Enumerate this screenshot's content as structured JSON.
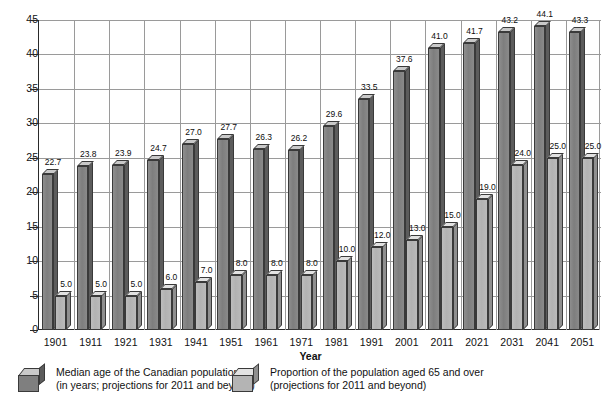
{
  "chart_data": {
    "type": "bar",
    "title": "",
    "subtitle": "",
    "xlabel": "Year",
    "ylabel": "",
    "grid": true,
    "legend_position": "bottom",
    "ylim": [
      0,
      45
    ],
    "yticks": [
      0,
      5,
      10,
      15,
      20,
      25,
      30,
      35,
      40,
      45
    ],
    "categories": [
      "1901",
      "1911",
      "1921",
      "1931",
      "1941",
      "1951",
      "1961",
      "1971",
      "1981",
      "1991",
      "2001",
      "2011",
      "2021",
      "2031",
      "2041",
      "2051"
    ],
    "series": [
      {
        "name": "Median age of the Canadian population",
        "name_line2": "(in years; projections for 2011 and beyond)",
        "color": "#7f7f7f",
        "values": [
          22.7,
          23.8,
          23.9,
          24.7,
          27.0,
          27.7,
          26.3,
          26.2,
          29.6,
          33.5,
          37.6,
          41.0,
          41.7,
          43.2,
          44.1,
          43.3
        ],
        "labels": [
          "22.7",
          "23.8",
          "23.9",
          "24.7",
          "27.0",
          "27.7",
          "26.3",
          "26.2",
          "29.6",
          "33.5",
          "37.6",
          "41.0",
          "41.7",
          "43.2",
          "44.1",
          "43.3"
        ]
      },
      {
        "name": "Proportion of the population aged 65 and over",
        "name_line2": "(projections for 2011 and beyond)",
        "color": "#b4b4b4",
        "values": [
          5.0,
          5.0,
          5.0,
          6.0,
          7.0,
          8.0,
          8.0,
          8.0,
          10.0,
          12.0,
          13.0,
          15.0,
          19.0,
          24.0,
          25.0,
          25.0
        ],
        "labels": [
          "5.0",
          "5.0",
          "5.0",
          "6.0",
          "7.0",
          "8.0",
          "8.0",
          "8.0",
          "10.0",
          "12.0",
          "13.0",
          "15.0",
          "19.0",
          "24.0",
          "25.0",
          "25.0"
        ]
      }
    ]
  },
  "legend": {
    "items": [
      {
        "line1": "Median age of the Canadian population",
        "line2": "(in years; projections for 2011 and beyond)",
        "swatch": "dark-cube-icon"
      },
      {
        "line1": "Proportion of the population aged 65 and over",
        "line2": "(projections for 2011 and beyond)",
        "swatch": "light-cube-icon"
      }
    ]
  },
  "axis": {
    "x_title": "Year"
  }
}
